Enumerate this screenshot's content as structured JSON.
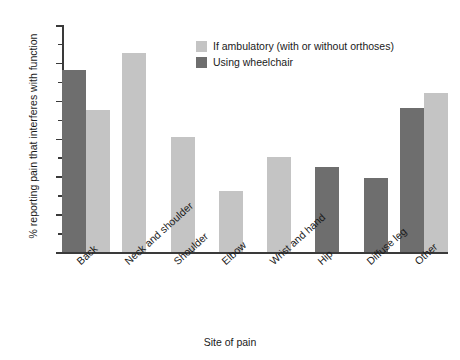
{
  "chart_data": {
    "type": "bar",
    "title": "",
    "xlabel": "Site of pain",
    "ylabel": "% reporting pain that interferes with function",
    "categories": [
      "Back",
      "Neck and shoulder",
      "Shoulder",
      "Elbow",
      "Wrist and hand",
      "Hip",
      "Diffuse leg",
      "Other"
    ],
    "series": [
      {
        "name": "If ambulatory (with or without orthoses)",
        "color": "#c4c4c4",
        "values": [
          37.5,
          52.5,
          30.5,
          16,
          25,
          null,
          null,
          42
        ]
      },
      {
        "name": "Using wheelchair",
        "color": "#6e6e6e",
        "values": [
          48,
          null,
          null,
          null,
          null,
          22.5,
          19.5,
          38
        ]
      }
    ],
    "ylim": [
      0,
      60
    ],
    "yticks": [
      0,
      10,
      20,
      30,
      40,
      50,
      60
    ],
    "yticks_minor": [
      5,
      15,
      25,
      35,
      45,
      55
    ],
    "grid": false,
    "legend_position": "top-right"
  },
  "legend": {
    "items": [
      {
        "label": "If ambulatory (with or without orthoses)",
        "color": "#c4c4c4"
      },
      {
        "label": "Using wheelchair",
        "color": "#6e6e6e"
      }
    ]
  },
  "axes": {
    "y_title": "% reporting pain that interferes with function",
    "x_title": "Site of pain",
    "y_tick_labels": [
      "60",
      "50",
      "40",
      "30",
      "20",
      "10",
      "0"
    ],
    "x_tick_labels": [
      "Back",
      "Neck and shoulder",
      "Shoulder",
      "Elbow",
      "Wrist and hand",
      "Hip",
      "Diffuse leg",
      "Other"
    ]
  },
  "colors": {
    "ambulatory": "#c4c4c4",
    "wheelchair": "#6e6e6e",
    "axis": "#3a3a3a",
    "background": "#ffffff"
  }
}
